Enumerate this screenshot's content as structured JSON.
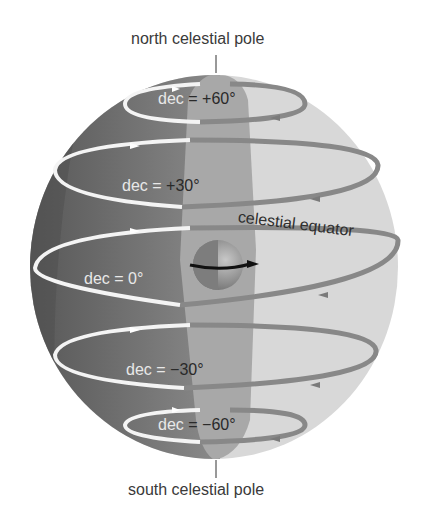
{
  "diagram": {
    "labels": {
      "north_pole": "north celestial pole",
      "south_pole": "south celestial pole",
      "equator": "celestial equator"
    },
    "declinations": [
      {
        "prefix": "dec",
        "eq": "=",
        "value": "+60°"
      },
      {
        "prefix": "dec",
        "eq": "=",
        "value": "+30°"
      },
      {
        "prefix": "dec",
        "eq": "=",
        "value": "0°"
      },
      {
        "prefix": "dec",
        "eq": "=",
        "value": "−30°"
      },
      {
        "prefix": "dec",
        "eq": "=",
        "value": "−60°"
      }
    ],
    "colors": {
      "sphere_dark": "#5f5f5f",
      "sphere_light": "#d6d6d6",
      "meridian_strip": "#a9a9a9",
      "circle_front": "#f2f2f2",
      "circle_back": "#8a8a8a",
      "earth_axis": "#111111"
    }
  }
}
